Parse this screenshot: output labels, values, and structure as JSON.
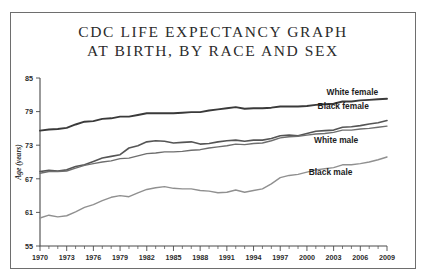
{
  "chart_data": {
    "type": "line",
    "title": "CDC LIFE EXPECTANCY GRAPH AT BIRTH, BY RACE AND SEX",
    "title_lines": [
      "CDC LIFE EXPECTANCY GRAPH",
      "AT BIRTH, BY RACE AND SEX"
    ],
    "xlabel": "",
    "ylabel": "Age (years)",
    "ylim": [
      55,
      85
    ],
    "xlim": [
      1970,
      2009
    ],
    "yticks": [
      55,
      61,
      67,
      73,
      79,
      85
    ],
    "xticks_labeled": [
      1970,
      1973,
      1976,
      1979,
      1982,
      1985,
      1988,
      1991,
      1994,
      1997,
      2000,
      2003,
      2006,
      2009
    ],
    "xtick_minor_step": 1,
    "grid": false,
    "legend_position": "inline-right-labels",
    "x": [
      1970,
      1971,
      1972,
      1973,
      1974,
      1975,
      1976,
      1977,
      1978,
      1979,
      1980,
      1981,
      1982,
      1983,
      1984,
      1985,
      1986,
      1987,
      1988,
      1989,
      1990,
      1991,
      1992,
      1993,
      1994,
      1995,
      1996,
      1997,
      1998,
      1999,
      2000,
      2001,
      2002,
      2003,
      2004,
      2005,
      2006,
      2007,
      2008,
      2009
    ],
    "series": [
      {
        "name": "White female",
        "color": "#3a3a3a",
        "values": [
          75.6,
          75.8,
          75.9,
          76.1,
          76.7,
          77.2,
          77.3,
          77.7,
          77.8,
          78.1,
          78.1,
          78.4,
          78.7,
          78.7,
          78.7,
          78.7,
          78.8,
          78.9,
          78.9,
          79.2,
          79.4,
          79.6,
          79.8,
          79.5,
          79.6,
          79.6,
          79.7,
          79.9,
          79.9,
          79.9,
          80.0,
          80.2,
          80.3,
          80.4,
          80.8,
          80.8,
          81.0,
          81.1,
          81.2,
          81.3
        ],
        "label_x": 2002.2,
        "label_y": 82.0
      },
      {
        "name": "Black female",
        "color": "#555555",
        "values": [
          68.3,
          68.5,
          68.4,
          68.6,
          69.2,
          69.5,
          70.1,
          70.7,
          71.0,
          71.3,
          72.5,
          72.9,
          73.6,
          73.8,
          73.7,
          73.4,
          73.5,
          73.6,
          73.2,
          73.3,
          73.6,
          73.8,
          73.9,
          73.7,
          73.9,
          73.9,
          74.2,
          74.7,
          74.8,
          74.7,
          75.1,
          75.5,
          75.6,
          75.7,
          76.2,
          76.3,
          76.5,
          76.8,
          77.0,
          77.4
        ],
        "label_x": 2001.2,
        "label_y": 79.4
      },
      {
        "name": "White male",
        "color": "#6e6e6e",
        "values": [
          68.0,
          68.3,
          68.3,
          68.4,
          68.9,
          69.4,
          69.7,
          70.0,
          70.2,
          70.6,
          70.7,
          71.1,
          71.5,
          71.6,
          71.8,
          71.8,
          71.9,
          72.1,
          72.2,
          72.5,
          72.7,
          72.9,
          73.2,
          73.1,
          73.3,
          73.4,
          73.8,
          74.3,
          74.5,
          74.6,
          74.8,
          75.0,
          75.1,
          75.3,
          75.7,
          75.7,
          75.9,
          76.0,
          76.2,
          76.4
        ],
        "label_x": 2000.8,
        "label_y": 73.4
      },
      {
        "name": "Black male",
        "color": "#909090",
        "values": [
          60.0,
          60.5,
          60.2,
          60.4,
          61.1,
          61.9,
          62.4,
          63.1,
          63.7,
          64.0,
          63.8,
          64.5,
          65.1,
          65.4,
          65.6,
          65.3,
          65.2,
          65.2,
          64.9,
          64.8,
          64.5,
          64.6,
          65.0,
          64.6,
          64.9,
          65.2,
          66.1,
          67.2,
          67.6,
          67.8,
          68.2,
          68.6,
          68.8,
          69.0,
          69.5,
          69.5,
          69.7,
          70.0,
          70.4,
          70.9
        ],
        "label_x": 2000.2,
        "label_y": 67.6
      }
    ]
  }
}
